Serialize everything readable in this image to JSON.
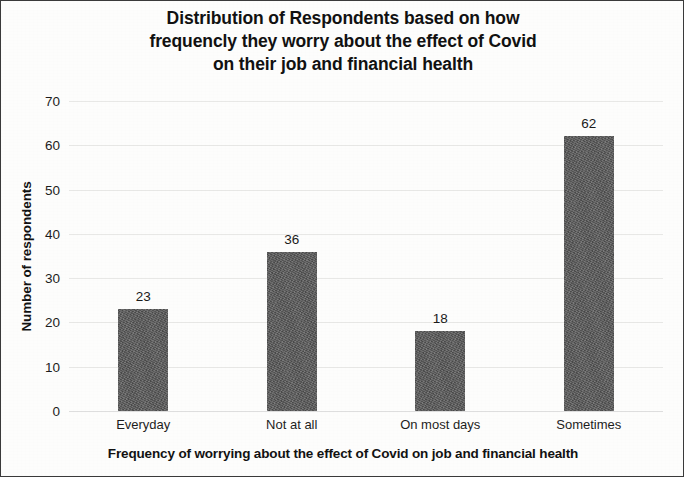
{
  "chart_data": {
    "type": "bar",
    "title": "Distribution of Respondents based on how frequencly they worry about the effect of Covid on their job and financial health",
    "title_lines": [
      "Distribution of Respondents based on how",
      "frequencly they worry about the effect of Covid",
      "on their job and financial health"
    ],
    "categories": [
      "Everyday",
      "Not at all",
      "On most days",
      "Sometimes"
    ],
    "values": [
      23,
      36,
      18,
      62
    ],
    "xlabel": "Frequency of worrying about the effect of Covid on job and financial health",
    "ylabel": "Number of respondents",
    "ylim": [
      0,
      70
    ],
    "ytick_labels": [
      "70",
      "60",
      "50",
      "40",
      "30",
      "20",
      "10",
      "0"
    ],
    "ytick_values": [
      70,
      60,
      50,
      40,
      30,
      20,
      10,
      0
    ],
    "grid": true,
    "grid_axis": "y",
    "legend": false,
    "bar_color": "#585858",
    "grid_color": "#e8e8e6",
    "text_color": "#1a1a1a",
    "background_color": "#fdfdfc",
    "border_color": "#3a3a3a"
  }
}
